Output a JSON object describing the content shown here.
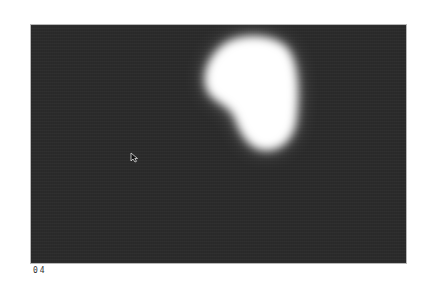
{
  "scene": {
    "description": "Dark grainy frame with a bright white amorphous blob of light in the upper right",
    "frame_label": "04",
    "colors": {
      "page_background": "#ffffff",
      "frame_background": "#2b2b2b",
      "frame_border": "#b8b8b8",
      "blob": "#ffffff",
      "label_text": "#333333"
    }
  },
  "elements": {
    "blob": {
      "shape": "kidney-shaped glow"
    },
    "cursor": {
      "icon": "arrow-cursor-icon"
    }
  }
}
